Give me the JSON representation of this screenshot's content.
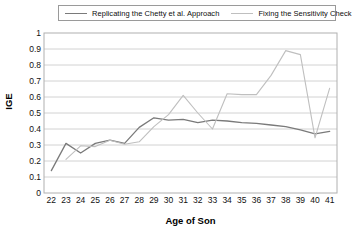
{
  "chart_data": {
    "type": "line",
    "title": "",
    "xlabel": "Age of Son",
    "ylabel": "IGE",
    "xlim": [
      22,
      41
    ],
    "ylim": [
      0,
      1
    ],
    "ytick_step": 0.1,
    "grid": "horizontal",
    "legend_position": "top",
    "x": [
      22,
      23,
      24,
      25,
      26,
      27,
      28,
      29,
      30,
      31,
      32,
      33,
      34,
      35,
      36,
      37,
      38,
      39,
      40,
      41
    ],
    "categories": [
      "22",
      "23",
      "24",
      "25",
      "26",
      "27",
      "28",
      "29",
      "30",
      "31",
      "32",
      "33",
      "34",
      "35",
      "36",
      "37",
      "38",
      "39",
      "40",
      "41"
    ],
    "ytick_labels": [
      "1",
      "0.9",
      "0.8",
      "0.7",
      "0.6",
      "0.5",
      "0.4",
      "0.3",
      "0.2",
      "0.1",
      "0"
    ],
    "ytick_values": [
      1,
      0.9,
      0.8,
      0.7,
      0.6,
      0.5,
      0.4,
      0.3,
      0.2,
      0.1,
      0
    ],
    "series": [
      {
        "name": "Replicating the Chetty et al. Approach",
        "color": "#7a7a7a",
        "values": [
          0.14,
          0.31,
          0.25,
          0.31,
          0.33,
          0.31,
          0.41,
          0.47,
          0.455,
          0.46,
          0.44,
          0.455,
          0.45,
          0.44,
          0.435,
          0.425,
          0.415,
          0.395,
          0.37,
          0.385
        ]
      },
      {
        "name": "Fixing the Sensitivity Check",
        "color": "#bfbfbf",
        "values": [
          null,
          0.21,
          0.295,
          0.29,
          0.33,
          0.305,
          0.32,
          0.415,
          0.49,
          0.61,
          0.5,
          0.4,
          0.62,
          0.615,
          0.615,
          0.735,
          0.89,
          0.865,
          0.345,
          0.655
        ]
      }
    ]
  },
  "legend": {
    "entries": [
      {
        "label": "Replicating the Chetty et al. Approach",
        "color": "#7a7a7a"
      },
      {
        "label": "Fixing the Sensitivity Check",
        "color": "#bfbfbf"
      }
    ]
  }
}
